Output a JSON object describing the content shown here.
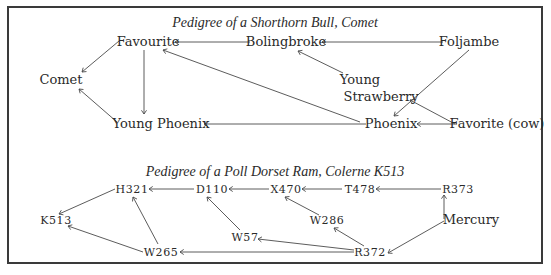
{
  "diagrams": [
    {
      "id": "comet",
      "title": "Pedigree of  a Shorthorn Bull, Comet",
      "title_pos": [
        275,
        27
      ],
      "nodes": [
        {
          "id": "favourite",
          "label": "Favourite",
          "x": 148,
          "y": 46,
          "style": "node"
        },
        {
          "id": "bolingbroke",
          "label": "Bolingbroke",
          "x": 286,
          "y": 46,
          "style": "node"
        },
        {
          "id": "foljambe",
          "label": "Foljambe",
          "x": 469,
          "y": 46,
          "style": "node"
        },
        {
          "id": "comet",
          "label": "Comet",
          "x": 61,
          "y": 84,
          "style": "node"
        },
        {
          "id": "young-strawberry-1",
          "label": "Young",
          "x": 360,
          "y": 84,
          "style": "node"
        },
        {
          "id": "young-strawberry-2",
          "label": "Strawberry",
          "x": 381,
          "y": 101,
          "style": "node"
        },
        {
          "id": "young-phoenix",
          "label": "Young Phoenix",
          "x": 161,
          "y": 128,
          "style": "node"
        },
        {
          "id": "phoenix",
          "label": "Phoenix",
          "x": 391,
          "y": 128,
          "style": "node"
        },
        {
          "id": "favorite-cow",
          "label": "Favorite (cow)",
          "x": 497,
          "y": 128,
          "style": "node"
        }
      ],
      "edges": [
        {
          "from": "bolingbroke",
          "to": "favourite",
          "x1": 250,
          "y1": 42,
          "x2": 175,
          "y2": 42
        },
        {
          "from": "foljambe",
          "to": "bolingbroke",
          "x1": 443,
          "y1": 42,
          "x2": 322,
          "y2": 42
        },
        {
          "from": "favourite",
          "to": "comet",
          "x1": 119,
          "y1": 41,
          "x2": 82,
          "y2": 72
        },
        {
          "from": "young-phoenix",
          "to": "comet",
          "x1": 117,
          "y1": 122,
          "x2": 79,
          "y2": 89
        },
        {
          "from": "favourite",
          "to": "young-phoenix",
          "x1": 144,
          "y1": 50,
          "x2": 144,
          "y2": 114
        },
        {
          "from": "phoenix",
          "to": "young-phoenix",
          "x1": 366,
          "y1": 124,
          "x2": 204,
          "y2": 124
        },
        {
          "from": "phoenix",
          "to": "favourite",
          "x1": 360,
          "y1": 122,
          "x2": 163,
          "y2": 50
        },
        {
          "from": "young-strawberry",
          "to": "bolingbroke",
          "x1": 343,
          "y1": 73,
          "x2": 298,
          "y2": 51
        },
        {
          "from": "foljambe",
          "to": "phoenix",
          "x1": 469,
          "y1": 50,
          "x2": 394,
          "y2": 116
        },
        {
          "from": "favorite-cow",
          "to": "young-strawberry",
          "x1": 455,
          "y1": 124,
          "x2": 410,
          "y2": 100
        },
        {
          "from": "favorite-cow",
          "to": "phoenix",
          "x1": 457,
          "y1": 124,
          "x2": 417,
          "y2": 124
        }
      ]
    },
    {
      "id": "colerne",
      "title": "Pedigree of  a Poll Dorset Ram, Colerne K513",
      "title_pos": [
        275,
        176
      ],
      "nodes": [
        {
          "id": "h321",
          "label": "H321",
          "x": 132,
          "y": 193,
          "style": "sc"
        },
        {
          "id": "d110",
          "label": "D110",
          "x": 212,
          "y": 193,
          "style": "sc"
        },
        {
          "id": "x470",
          "label": "X470",
          "x": 286,
          "y": 193,
          "style": "sc"
        },
        {
          "id": "t478",
          "label": "T478",
          "x": 360,
          "y": 193,
          "style": "sc"
        },
        {
          "id": "r373",
          "label": "R373",
          "x": 458,
          "y": 193,
          "style": "sc"
        },
        {
          "id": "k513",
          "label": "K513",
          "x": 56,
          "y": 224,
          "style": "sc"
        },
        {
          "id": "w286",
          "label": "W286",
          "x": 327,
          "y": 224,
          "style": "sc"
        },
        {
          "id": "mercury",
          "label": "Mercury",
          "x": 471,
          "y": 224,
          "style": "node"
        },
        {
          "id": "w57",
          "label": "W57",
          "x": 245,
          "y": 241,
          "style": "sc"
        },
        {
          "id": "w265",
          "label": "W265",
          "x": 161,
          "y": 256,
          "style": "sc"
        },
        {
          "id": "r372",
          "label": "R372",
          "x": 370,
          "y": 256,
          "style": "sc"
        }
      ],
      "edges": [
        {
          "from": "d110",
          "to": "h321",
          "x1": 194,
          "y1": 189,
          "x2": 149,
          "y2": 189
        },
        {
          "from": "x470",
          "to": "d110",
          "x1": 269,
          "y1": 189,
          "x2": 229,
          "y2": 189
        },
        {
          "from": "t478",
          "to": "x470",
          "x1": 342,
          "y1": 189,
          "x2": 302,
          "y2": 189
        },
        {
          "from": "r373",
          "to": "t478",
          "x1": 441,
          "y1": 189,
          "x2": 376,
          "y2": 189
        },
        {
          "from": "h321",
          "to": "k513",
          "x1": 115,
          "y1": 189,
          "x2": 59,
          "y2": 214
        },
        {
          "from": "w265",
          "to": "k513",
          "x1": 143,
          "y1": 252,
          "x2": 68,
          "y2": 226
        },
        {
          "from": "w265",
          "to": "h321",
          "x1": 158,
          "y1": 244,
          "x2": 133,
          "y2": 197
        },
        {
          "from": "r372",
          "to": "w265",
          "x1": 354,
          "y1": 252,
          "x2": 180,
          "y2": 252
        },
        {
          "from": "w57",
          "to": "d110",
          "x1": 240,
          "y1": 230,
          "x2": 207,
          "y2": 197
        },
        {
          "from": "r372",
          "to": "w57",
          "x1": 354,
          "y1": 250,
          "x2": 258,
          "y2": 239
        },
        {
          "from": "w286",
          "to": "x470",
          "x1": 319,
          "y1": 215,
          "x2": 285,
          "y2": 197
        },
        {
          "from": "r372",
          "to": "w286",
          "x1": 364,
          "y1": 246,
          "x2": 334,
          "y2": 228
        },
        {
          "from": "mercury",
          "to": "r373",
          "x1": 444,
          "y1": 219,
          "x2": 444,
          "y2": 195
        },
        {
          "from": "mercury",
          "to": "r372",
          "x1": 444,
          "y1": 221,
          "x2": 388,
          "y2": 253
        }
      ]
    }
  ],
  "colors": {
    "ink": "#2a2a2a",
    "line": "#4a4a4a",
    "border": "#3a3a3a",
    "background": "#ffffff"
  }
}
